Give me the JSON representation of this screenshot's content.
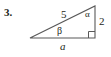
{
  "figure": {
    "problem_number": "3.",
    "type": "right-triangle-diagram",
    "stroke_color": "#595959",
    "text_color": "#231f20",
    "background_color": "#ffffff",
    "labels": {
      "hypotenuse": "5",
      "vertical_side": "2",
      "base": "a",
      "angle_top_right": "α",
      "angle_bottom_left": "β",
      "right_angle_marker": "right-angle-square"
    },
    "geometry": {
      "vertex_left": [
        30,
        38
      ],
      "vertex_top_right": [
        95,
        6
      ],
      "vertex_bottom_right": [
        95,
        38
      ],
      "base_length_label": "a",
      "height_label": "2",
      "hypotenuse_label": "5"
    }
  }
}
